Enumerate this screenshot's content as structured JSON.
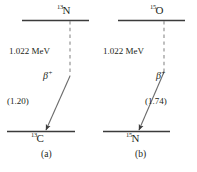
{
  "figure": {
    "type": "beta-plus-decay-level-diagram",
    "line_color": "#3b3b3b",
    "text_color": "#231f20"
  },
  "panel_a": {
    "caption": "(a)",
    "parent": {
      "mass_number": "13",
      "symbol": "N"
    },
    "daughter": {
      "mass_number": "13",
      "symbol": "C"
    },
    "energy_label": "1.022 MeV",
    "beta_symbol": "β",
    "beta_superscript": "+",
    "endpoint_energy": "(1.20)"
  },
  "panel_b": {
    "caption": "(b)",
    "parent": {
      "mass_number": "15",
      "symbol": "O"
    },
    "daughter": {
      "mass_number": "15",
      "symbol": "N"
    },
    "energy_label": "1.022 MeV",
    "beta_symbol": "β",
    "beta_superscript": "+",
    "endpoint_energy": "(1.74)"
  }
}
